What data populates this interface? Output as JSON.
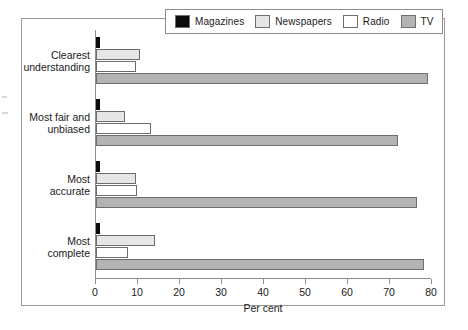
{
  "chart_data": {
    "type": "bar",
    "orientation": "horizontal",
    "title": "",
    "xlabel": "Per cent",
    "ylabel": "",
    "xlim": [
      0,
      80
    ],
    "xticks": [
      0,
      10,
      20,
      30,
      40,
      50,
      60,
      70,
      80
    ],
    "grid": false,
    "legend_position": "top",
    "categories": [
      "Clearest understanding",
      "Most fair and unbiased",
      "Most accurate",
      "Most complete"
    ],
    "series": [
      {
        "name": "Magazines",
        "color": "#0b0b0b",
        "values": [
          1,
          1,
          1,
          1
        ]
      },
      {
        "name": "Newspapers",
        "color": "#e6e6e6",
        "values": [
          10.5,
          7,
          9.5,
          14
        ]
      },
      {
        "name": "Radio",
        "color": "#ffffff",
        "values": [
          9.5,
          13,
          9.8,
          7.5
        ]
      },
      {
        "name": "TV",
        "color": "#b3b3b3",
        "values": [
          79,
          72,
          76.5,
          78
        ]
      }
    ]
  },
  "legend": {
    "entries": [
      {
        "label": "Magazines"
      },
      {
        "label": "Newspapers"
      },
      {
        "label": "Radio"
      },
      {
        "label": "TV"
      }
    ]
  },
  "axis": {
    "x_label": "Per cent",
    "x_tick_labels": [
      "0",
      "10",
      "20",
      "30",
      "40",
      "50",
      "60",
      "70",
      "80"
    ],
    "category_labels": [
      [
        "Clearest",
        "understanding"
      ],
      [
        "Most fair and",
        "unbiased"
      ],
      [
        "Most",
        "accurate"
      ],
      [
        "Most",
        "complete"
      ]
    ]
  }
}
